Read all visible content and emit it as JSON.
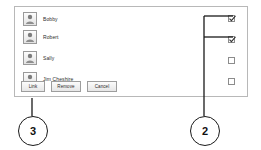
{
  "panel": {
    "name": "user-permission-panel",
    "users": [
      {
        "name": "Bobby",
        "icon": "user-icon",
        "checked": true
      },
      {
        "name": "Robert",
        "icon": "user-icon",
        "checked": true
      },
      {
        "name": "Sally",
        "icon": "user-icon",
        "checked": false
      },
      {
        "name": "Jim Cheshire",
        "icon": "user-icon",
        "checked": false
      }
    ],
    "buttons": [
      {
        "label": "Link"
      },
      {
        "label": "Remove"
      },
      {
        "label": "Cancel"
      }
    ]
  },
  "callouts": [
    {
      "id": "callout-3",
      "label": "3"
    },
    {
      "id": "callout-2",
      "label": "2"
    }
  ],
  "colors": {
    "panel_border": "#b8b8b8",
    "text": "#2c2c2c",
    "callout_stroke": "#1a1a1a",
    "leader_line": "#1a1a1a",
    "checkbox_border": "#8c8c8c"
  }
}
